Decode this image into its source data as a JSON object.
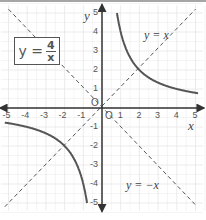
{
  "formula": {
    "lhs": "y =",
    "numerator": "4",
    "denominator": "x"
  },
  "labels": {
    "y_eq_x": "y = x",
    "y_eq_neg_x": "y = −x",
    "x_axis": "x",
    "y_axis": "y",
    "origin": "O"
  },
  "colors": {
    "curve": "#555555",
    "axis": "#333333",
    "grid": "#e6e6e6",
    "dashed": "#555555"
  },
  "chart_data": {
    "type": "line",
    "xlabel": "x",
    "ylabel": "y",
    "xlim": [
      -5,
      5
    ],
    "ylim": [
      -5,
      5
    ],
    "grid": true,
    "x_ticks": [
      "-5",
      "-4",
      "-3",
      "-2",
      "-1",
      "1",
      "2",
      "3",
      "4",
      "5"
    ],
    "y_ticks": [
      "5",
      "4",
      "3",
      "2",
      "1",
      "-1",
      "-2",
      "-3",
      "-4",
      "-5"
    ],
    "series": [
      {
        "name": "y = 4/x (x>0)",
        "style": "solid",
        "x": [
          0.8,
          1,
          1.5,
          2,
          2.5,
          3,
          4,
          5
        ],
        "y": [
          5,
          4,
          2.67,
          2,
          1.6,
          1.33,
          1,
          0.8
        ]
      },
      {
        "name": "y = 4/x (x<0)",
        "style": "solid",
        "x": [
          -5,
          -4,
          -3,
          -2.5,
          -2,
          -1.5,
          -1,
          -0.8
        ],
        "y": [
          -0.8,
          -1,
          -1.33,
          -1.6,
          -2,
          -2.67,
          -4,
          -5
        ]
      },
      {
        "name": "y = x",
        "style": "dashed",
        "x": [
          -5,
          5
        ],
        "y": [
          -5,
          5
        ]
      },
      {
        "name": "y = -x",
        "style": "dashed",
        "x": [
          -5,
          5
        ],
        "y": [
          5,
          -5
        ]
      }
    ],
    "annotations": [
      "y = x",
      "y = −x",
      "O",
      "y = 4/x"
    ]
  }
}
